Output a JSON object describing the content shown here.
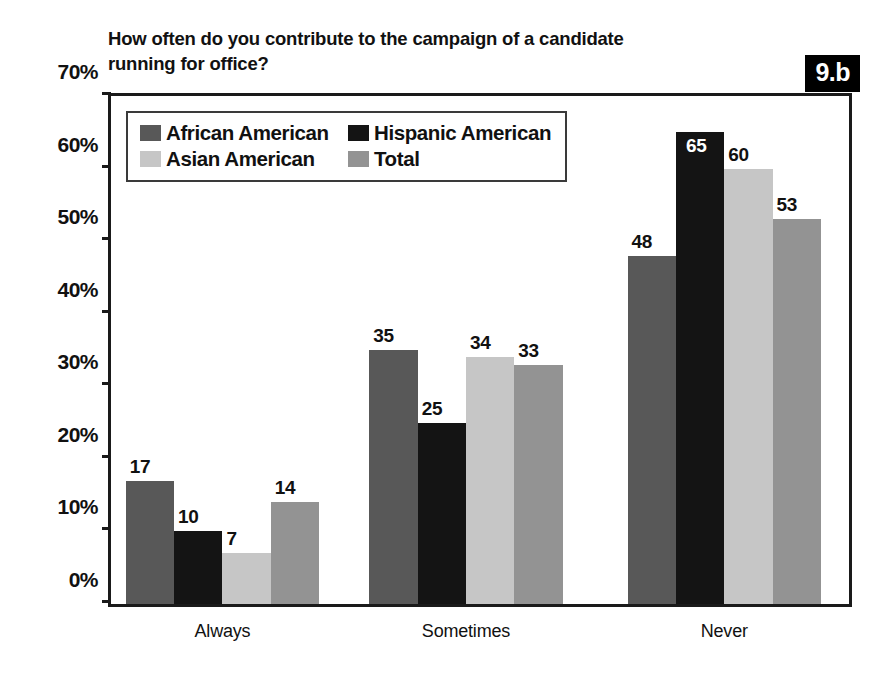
{
  "figure": {
    "badge_label": "9.b",
    "title": "How often do you contribute to the campaign of a candidate\nrunning for office?"
  },
  "chart_data": {
    "type": "bar",
    "title": "How often do you contribute to the campaign of a candidate running for office?",
    "xlabel": "",
    "ylabel": "",
    "ylim": [
      0,
      70
    ],
    "grid": false,
    "legend_position": "top-left inside plot",
    "y_tick_labels": [
      "0%",
      "10%",
      "20%",
      "30%",
      "40%",
      "50%",
      "60%",
      "70%"
    ],
    "y_ticks": [
      0,
      10,
      20,
      30,
      40,
      50,
      60,
      70
    ],
    "categories": [
      "Always",
      "Sometimes",
      "Never"
    ],
    "series": [
      {
        "name": "African American",
        "color": "#585858",
        "values": [
          17,
          35,
          48
        ]
      },
      {
        "name": "Hispanic American",
        "color": "#141414",
        "values": [
          10,
          25,
          65
        ]
      },
      {
        "name": "Asian American",
        "color": "#c6c6c6",
        "values": [
          7,
          34,
          60
        ]
      },
      {
        "name": "Total",
        "color": "#939393",
        "values": [
          14,
          33,
          53
        ]
      }
    ],
    "value_labels": {
      "Always": [
        "17",
        "10",
        "7",
        "14"
      ],
      "Sometimes": [
        "35",
        "25",
        "34",
        "33"
      ],
      "Never": [
        "48",
        "65",
        "60",
        "53"
      ]
    }
  },
  "legend": {
    "items": [
      {
        "label": "African American",
        "color": "#585858"
      },
      {
        "label": "Hispanic American",
        "color": "#141414"
      },
      {
        "label": "Asian American",
        "color": "#c6c6c6"
      },
      {
        "label": "Total",
        "color": "#939393"
      }
    ]
  }
}
